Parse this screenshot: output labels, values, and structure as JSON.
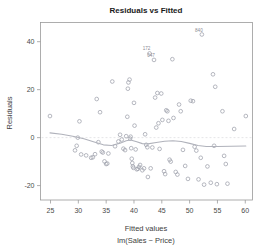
{
  "chart_data": {
    "type": "scatter",
    "title": "Residuals vs Fitted",
    "xlabel": "Fitted values",
    "sublabel": "lm(Sales ~ Price)",
    "ylabel": "Residuals",
    "xlim": [
      23.2,
      61.3
    ],
    "ylim": [
      -26.0,
      48.0
    ],
    "xticks": [
      25,
      30,
      35,
      40,
      45,
      50,
      55,
      60
    ],
    "xtick_labels": [
      "25",
      "30",
      "35",
      "40",
      "45",
      "50",
      "55",
      "60"
    ],
    "yticks": [
      -20,
      0,
      20,
      40
    ],
    "ytick_labels": [
      "-20",
      "0",
      "20",
      "40"
    ],
    "grid": false,
    "legend": "none",
    "marker": "open-circle",
    "point_color": "#9ea0ab",
    "smoother_color": "#b0b2bb",
    "zero_reference_line": 0,
    "annotations": [
      {
        "label": "840",
        "x": 52.2,
        "y": 44.2
      },
      {
        "label": "172",
        "x": 42.8,
        "y": 36.4
      },
      {
        "label": "047",
        "x": 43.6,
        "y": 33.6
      }
    ],
    "points": [
      {
        "x": 24.9,
        "y": 9.0
      },
      {
        "x": 29.4,
        "y": -5.3
      },
      {
        "x": 29.7,
        "y": -3.4
      },
      {
        "x": 29.9,
        "y": 0.0
      },
      {
        "x": 30.2,
        "y": 6.8
      },
      {
        "x": 30.5,
        "y": -7.0
      },
      {
        "x": 31.4,
        "y": -7.4
      },
      {
        "x": 32.3,
        "y": -8.4
      },
      {
        "x": 32.6,
        "y": -8.2
      },
      {
        "x": 33.0,
        "y": -6.9
      },
      {
        "x": 33.3,
        "y": 16.1
      },
      {
        "x": 33.6,
        "y": -1.9
      },
      {
        "x": 33.9,
        "y": 10.6
      },
      {
        "x": 34.2,
        "y": -5.8
      },
      {
        "x": 34.4,
        "y": -6.2
      },
      {
        "x": 34.7,
        "y": -9.9
      },
      {
        "x": 35.0,
        "y": -11.0
      },
      {
        "x": 35.2,
        "y": -10.8
      },
      {
        "x": 35.4,
        "y": -6.6
      },
      {
        "x": 36.1,
        "y": 23.4
      },
      {
        "x": 36.6,
        "y": -3.6
      },
      {
        "x": 37.2,
        "y": -1.6
      },
      {
        "x": 37.5,
        "y": 1.2
      },
      {
        "x": 37.8,
        "y": -0.8
      },
      {
        "x": 38.1,
        "y": -4.6
      },
      {
        "x": 38.4,
        "y": -5.2
      },
      {
        "x": 38.6,
        "y": 0.6
      },
      {
        "x": 38.8,
        "y": 8.7
      },
      {
        "x": 38.9,
        "y": 20.4
      },
      {
        "x": 39.0,
        "y": 23.0
      },
      {
        "x": 39.2,
        "y": 24.2
      },
      {
        "x": 39.3,
        "y": -0.4
      },
      {
        "x": 39.4,
        "y": 0.4
      },
      {
        "x": 39.5,
        "y": -4.4
      },
      {
        "x": 39.6,
        "y": -8.8
      },
      {
        "x": 39.7,
        "y": -10.6
      },
      {
        "x": 39.8,
        "y": -12.0
      },
      {
        "x": 39.9,
        "y": -12.6
      },
      {
        "x": 40.0,
        "y": 14.5
      },
      {
        "x": 40.1,
        "y": 5.0
      },
      {
        "x": 40.3,
        "y": -4.9
      },
      {
        "x": 40.5,
        "y": -13.2
      },
      {
        "x": 40.7,
        "y": -13.0
      },
      {
        "x": 40.9,
        "y": -12.2
      },
      {
        "x": 41.1,
        "y": -11.4
      },
      {
        "x": 41.5,
        "y": -13.6
      },
      {
        "x": 41.8,
        "y": -12.8
      },
      {
        "x": 42.0,
        "y": 1.4
      },
      {
        "x": 42.2,
        "y": -3.0
      },
      {
        "x": 42.4,
        "y": -4.0
      },
      {
        "x": 42.5,
        "y": -16.4
      },
      {
        "x": 42.8,
        "y": 35.1
      },
      {
        "x": 43.0,
        "y": -12.8
      },
      {
        "x": 43.3,
        "y": -4.1
      },
      {
        "x": 43.6,
        "y": 32.4
      },
      {
        "x": 43.8,
        "y": 16.7
      },
      {
        "x": 44.0,
        "y": 4.2
      },
      {
        "x": 44.2,
        "y": 18.6
      },
      {
        "x": 44.4,
        "y": 6.0
      },
      {
        "x": 44.6,
        "y": -4.7
      },
      {
        "x": 44.9,
        "y": 18.4
      },
      {
        "x": 45.1,
        "y": 7.4
      },
      {
        "x": 45.4,
        "y": -14.0
      },
      {
        "x": 45.6,
        "y": -15.2
      },
      {
        "x": 45.8,
        "y": 11.4
      },
      {
        "x": 46.0,
        "y": 11.0
      },
      {
        "x": 46.2,
        "y": 7.0
      },
      {
        "x": 46.4,
        "y": -9.2
      },
      {
        "x": 46.6,
        "y": -10.0
      },
      {
        "x": 46.9,
        "y": 32.7
      },
      {
        "x": 47.1,
        "y": 8.2
      },
      {
        "x": 47.5,
        "y": -14.3
      },
      {
        "x": 47.8,
        "y": -15.4
      },
      {
        "x": 48.1,
        "y": 13.8
      },
      {
        "x": 48.4,
        "y": 11.0
      },
      {
        "x": 48.8,
        "y": -5.1
      },
      {
        "x": 49.2,
        "y": -11.8
      },
      {
        "x": 49.7,
        "y": -17.2
      },
      {
        "x": 50.2,
        "y": 15.4
      },
      {
        "x": 50.6,
        "y": 15.2
      },
      {
        "x": 50.9,
        "y": -3.8
      },
      {
        "x": 51.2,
        "y": -5.4
      },
      {
        "x": 51.6,
        "y": -17.4
      },
      {
        "x": 52.0,
        "y": -8.4
      },
      {
        "x": 52.2,
        "y": 43.0
      },
      {
        "x": 52.6,
        "y": -19.6
      },
      {
        "x": 53.2,
        "y": -12.0
      },
      {
        "x": 53.8,
        "y": -18.8
      },
      {
        "x": 54.2,
        "y": 26.4
      },
      {
        "x": 54.4,
        "y": -3.4
      },
      {
        "x": 54.6,
        "y": 21.2
      },
      {
        "x": 54.9,
        "y": -19.4
      },
      {
        "x": 55.9,
        "y": 11.0
      },
      {
        "x": 56.2,
        "y": -7.6
      },
      {
        "x": 56.5,
        "y": -11.0
      },
      {
        "x": 56.8,
        "y": -19.2
      },
      {
        "x": 58.0,
        "y": 3.6
      },
      {
        "x": 60.1,
        "y": 9.0
      }
    ],
    "smoother": [
      {
        "x": 24.9,
        "y": 2.0
      },
      {
        "x": 27.0,
        "y": 1.4
      },
      {
        "x": 29.0,
        "y": 0.6
      },
      {
        "x": 31.0,
        "y": -0.5
      },
      {
        "x": 33.0,
        "y": -1.9
      },
      {
        "x": 34.5,
        "y": -3.0
      },
      {
        "x": 36.0,
        "y": -3.3
      },
      {
        "x": 37.5,
        "y": -2.3
      },
      {
        "x": 38.6,
        "y": -1.3
      },
      {
        "x": 39.4,
        "y": -1.0
      },
      {
        "x": 40.5,
        "y": -1.7
      },
      {
        "x": 41.5,
        "y": -2.5
      },
      {
        "x": 42.5,
        "y": -2.6
      },
      {
        "x": 44.0,
        "y": -2.0
      },
      {
        "x": 45.5,
        "y": -1.5
      },
      {
        "x": 47.0,
        "y": -1.3
      },
      {
        "x": 48.5,
        "y": -1.6
      },
      {
        "x": 50.0,
        "y": -2.4
      },
      {
        "x": 51.5,
        "y": -3.3
      },
      {
        "x": 53.0,
        "y": -3.7
      },
      {
        "x": 55.0,
        "y": -3.7
      },
      {
        "x": 57.5,
        "y": -3.6
      },
      {
        "x": 60.1,
        "y": -3.5
      }
    ]
  }
}
